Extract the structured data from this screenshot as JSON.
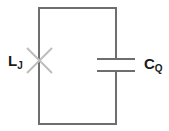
{
  "diagram": {
    "type": "LC circuit",
    "components": [
      {
        "id": "junction",
        "symbol": "josephson-junction",
        "label": "L",
        "subscript": "J"
      },
      {
        "id": "capacitor",
        "symbol": "capacitor",
        "label": "C",
        "subscript": "Q"
      }
    ],
    "colors": {
      "wire": "#6e6e6e",
      "junction": "#bdbdbd",
      "text": "#1a1a1a"
    }
  }
}
